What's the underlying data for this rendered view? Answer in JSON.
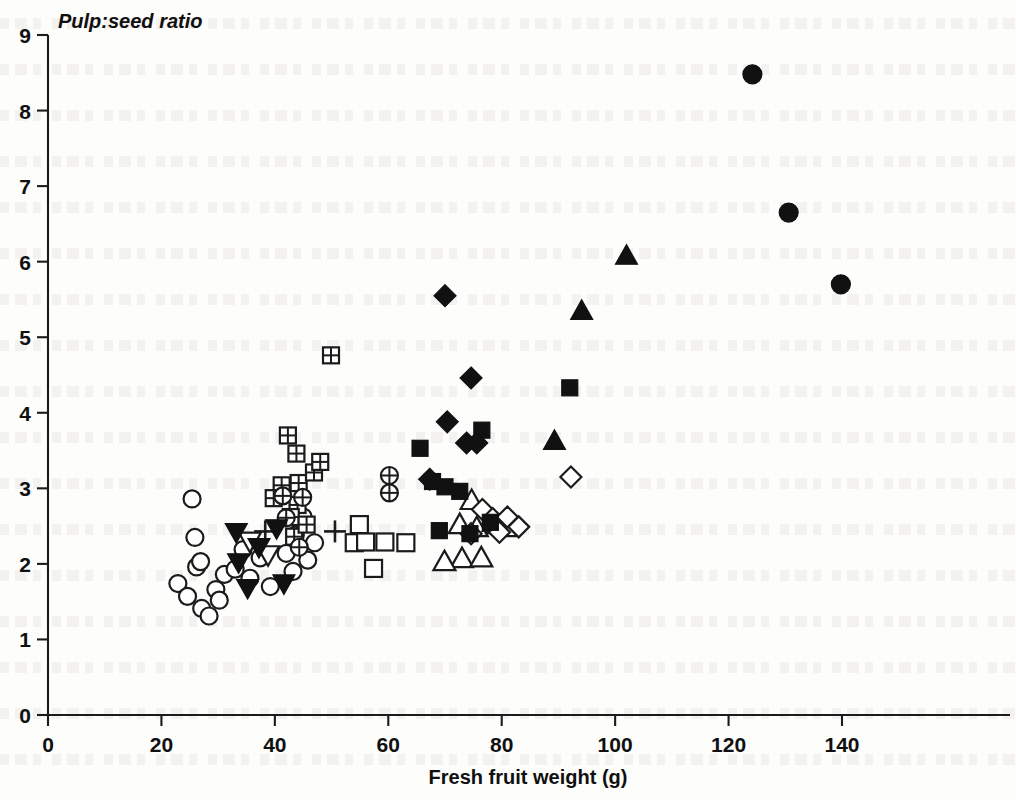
{
  "chart_data": {
    "type": "scatter",
    "title": "",
    "ylabel": "Pulp:seed ratio",
    "xlabel": "Fresh fruit weight (g)",
    "xlim": [
      0,
      147
    ],
    "ylim": [
      0,
      9
    ],
    "xticks": [
      0,
      20,
      40,
      60,
      80,
      100,
      120,
      140
    ],
    "yticks": [
      0,
      1,
      2,
      3,
      4,
      5,
      6,
      7,
      8,
      9
    ],
    "grid": false,
    "legend": "none",
    "series": [
      {
        "name": "open-circle",
        "marker": "open-circle",
        "points": [
          [
            25.4,
            2.86
          ],
          [
            25.9,
            2.35
          ],
          [
            22.9,
            1.74
          ],
          [
            24.6,
            1.57
          ],
          [
            26.2,
            1.96
          ],
          [
            26.9,
            2.03
          ],
          [
            27.1,
            1.41
          ],
          [
            28.4,
            1.31
          ],
          [
            29.6,
            1.66
          ],
          [
            30.2,
            1.52
          ],
          [
            31.1,
            1.86
          ],
          [
            33.0,
            1.93
          ],
          [
            34.4,
            2.19
          ],
          [
            35.6,
            1.81
          ],
          [
            37.4,
            2.08
          ],
          [
            39.2,
            1.7
          ],
          [
            42.0,
            2.14
          ],
          [
            43.6,
            2.38
          ],
          [
            45.0,
            2.62
          ],
          [
            45.8,
            2.05
          ],
          [
            47.0,
            2.28
          ],
          [
            43.2,
            1.9
          ]
        ]
      },
      {
        "name": "filled-down-triangle",
        "marker": "filled-down-triangle",
        "points": [
          [
            33.2,
            2.42
          ],
          [
            33.6,
            2.02
          ],
          [
            35.2,
            1.68
          ],
          [
            37.2,
            2.22
          ],
          [
            40.3,
            2.47
          ],
          [
            41.6,
            1.74
          ]
        ]
      },
      {
        "name": "open-down-triangle",
        "marker": "open-down-triangle",
        "points": [
          [
            35.6,
            2.3
          ],
          [
            38.8,
            2.12
          ]
        ]
      },
      {
        "name": "plus",
        "marker": "plus",
        "points": [
          [
            38.3,
            2.43
          ],
          [
            50.6,
            2.43
          ]
        ]
      },
      {
        "name": "crossed-square",
        "marker": "crossed-square",
        "points": [
          [
            49.9,
            4.76
          ],
          [
            42.3,
            3.7
          ],
          [
            43.8,
            3.46
          ],
          [
            41.2,
            3.04
          ],
          [
            44.2,
            3.07
          ],
          [
            39.8,
            2.87
          ],
          [
            44.0,
            2.78
          ],
          [
            46.9,
            3.21
          ],
          [
            48.0,
            3.35
          ],
          [
            42.8,
            2.62
          ],
          [
            43.4,
            2.36
          ],
          [
            45.6,
            2.52
          ]
        ]
      },
      {
        "name": "crossed-circle",
        "marker": "crossed-circle",
        "points": [
          [
            41.4,
            2.9
          ],
          [
            42.0,
            2.61
          ],
          [
            44.9,
            2.88
          ],
          [
            44.3,
            2.22
          ],
          [
            60.2,
            3.17
          ],
          [
            60.2,
            2.94
          ]
        ]
      },
      {
        "name": "open-square",
        "marker": "open-square",
        "points": [
          [
            54.9,
            2.52
          ],
          [
            54.0,
            2.28
          ],
          [
            56.0,
            2.29
          ],
          [
            59.4,
            2.29
          ],
          [
            57.4,
            1.94
          ],
          [
            63.1,
            2.28
          ]
        ]
      },
      {
        "name": "filled-square",
        "marker": "filled-square",
        "points": [
          [
            65.6,
            3.53
          ],
          [
            67.8,
            3.09
          ],
          [
            70.0,
            3.02
          ],
          [
            72.6,
            2.96
          ],
          [
            69.0,
            2.44
          ],
          [
            74.4,
            2.4
          ],
          [
            76.5,
            3.77
          ],
          [
            78.0,
            2.55
          ],
          [
            92.0,
            4.33
          ]
        ]
      },
      {
        "name": "filled-diamond",
        "marker": "filled-diamond",
        "points": [
          [
            70.0,
            5.55
          ],
          [
            74.6,
            4.46
          ],
          [
            70.4,
            3.88
          ],
          [
            73.8,
            3.6
          ],
          [
            75.6,
            3.6
          ],
          [
            67.3,
            3.12
          ]
        ]
      },
      {
        "name": "open-triangle",
        "marker": "open-up-triangle",
        "points": [
          [
            74.7,
            2.84
          ],
          [
            72.6,
            2.52
          ],
          [
            75.6,
            2.48
          ],
          [
            79.2,
            2.52
          ],
          [
            80.9,
            2.48
          ],
          [
            73.0,
            2.07
          ],
          [
            76.4,
            2.08
          ],
          [
            69.9,
            2.03
          ],
          [
            78.6,
            2.55
          ]
        ]
      },
      {
        "name": "open-diamond",
        "marker": "open-diamond",
        "points": [
          [
            76.6,
            2.72
          ],
          [
            78.4,
            2.6
          ],
          [
            81.0,
            2.62
          ],
          [
            79.6,
            2.42
          ],
          [
            83.0,
            2.49
          ],
          [
            74.6,
            2.4
          ],
          [
            92.2,
            3.15
          ]
        ]
      },
      {
        "name": "filled-up-triangle",
        "marker": "filled-up-triangle",
        "points": [
          [
            102.0,
            6.08
          ],
          [
            94.1,
            5.35
          ],
          [
            89.3,
            3.63
          ]
        ]
      },
      {
        "name": "filled-circle",
        "marker": "filled-circle",
        "points": [
          [
            124.2,
            8.48
          ],
          [
            130.6,
            6.65
          ],
          [
            139.8,
            5.7
          ]
        ]
      }
    ]
  },
  "axes": {
    "y_title": "Pulp:seed ratio",
    "x_title": "Fresh fruit weight (g)",
    "y_tick_labels": [
      "9",
      "8",
      "7",
      "6",
      "5",
      "4",
      "3",
      "2",
      "1",
      "0"
    ],
    "x_tick_labels": [
      "0",
      "20",
      "40",
      "60",
      "80",
      "100",
      "120",
      "140"
    ]
  },
  "colors": {
    "ink": "#111111",
    "paper": "#fdfdfb"
  }
}
